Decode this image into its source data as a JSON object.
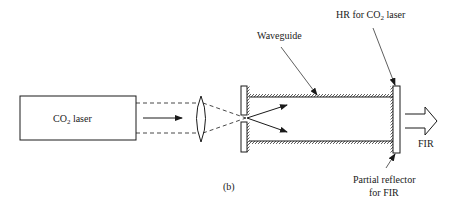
{
  "figure": {
    "panel_label": "(b)",
    "components": {
      "laser": {
        "label_main": "CO",
        "label_sub": "2",
        "label_rest": " laser"
      },
      "waveguide": {
        "label": "Waveguide"
      },
      "hr_mirror": {
        "label_main": "HR for CO",
        "label_sub": "2",
        "label_rest": " laser"
      },
      "partial_reflector": {
        "label_line1": "Partial reflector",
        "label_line2": "for FIR"
      },
      "output": {
        "label": "FIR"
      }
    }
  }
}
